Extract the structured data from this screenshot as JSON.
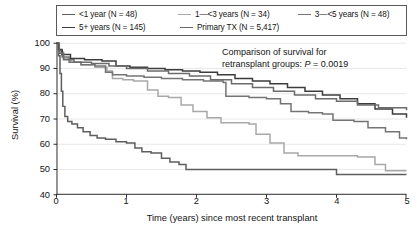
{
  "chart_data": {
    "type": "line",
    "title": "",
    "subtitle": "",
    "xlabel": "Time (years) since most recent transplant",
    "ylabel": "Survival (%)",
    "xlim": [
      0,
      5
    ],
    "ylim": [
      40,
      100
    ],
    "xticks": [
      0,
      1,
      2,
      3,
      4,
      5
    ],
    "yticks": [
      40,
      50,
      60,
      70,
      80,
      90,
      100
    ],
    "grid": "horizontal",
    "legend_position": "top",
    "annotation_line1": "Comparison of survival for",
    "annotation_line2_prefix": "retransplant groups: ",
    "annotation_p_symbol": "P",
    "annotation_p_value": " = 0.0019",
    "series": [
      {
        "name": "<1 year (N = 48)",
        "label": "<1 year (N = 48)",
        "color": "#5e5e5e",
        "n": 48,
        "points": [
          [
            0.0,
            100.0
          ],
          [
            0.03,
            95.0
          ],
          [
            0.05,
            88.0
          ],
          [
            0.07,
            81.0
          ],
          [
            0.09,
            75.0
          ],
          [
            0.12,
            71.0
          ],
          [
            0.16,
            69.0
          ],
          [
            0.22,
            68.0
          ],
          [
            0.3,
            66.5
          ],
          [
            0.38,
            65.0
          ],
          [
            0.48,
            63.5
          ],
          [
            0.58,
            62.5
          ],
          [
            0.7,
            62.0
          ],
          [
            0.85,
            61.0
          ],
          [
            1.0,
            60.5
          ],
          [
            1.12,
            58.5
          ],
          [
            1.22,
            57.0
          ],
          [
            1.35,
            56.5
          ],
          [
            1.5,
            54.5
          ],
          [
            1.62,
            53.0
          ],
          [
            1.75,
            52.0
          ],
          [
            1.85,
            50.0
          ],
          [
            2.6,
            50.0
          ],
          [
            3.9,
            50.0
          ],
          [
            4.0,
            48.0
          ],
          [
            5.0,
            48.0
          ]
        ]
      },
      {
        "name": "1—<3 years (N = 34)",
        "label": "1—<3 years (N = 34)",
        "color": "#a8a8a8",
        "n": 34,
        "points": [
          [
            0.0,
            100.0
          ],
          [
            0.04,
            96.5
          ],
          [
            0.1,
            94.0
          ],
          [
            0.2,
            92.5
          ],
          [
            0.35,
            91.5
          ],
          [
            0.55,
            90.5
          ],
          [
            0.72,
            89.0
          ],
          [
            0.8,
            86.0
          ],
          [
            0.95,
            85.5
          ],
          [
            1.1,
            85.0
          ],
          [
            1.3,
            81.5
          ],
          [
            1.45,
            79.0
          ],
          [
            1.6,
            78.5
          ],
          [
            1.78,
            75.5
          ],
          [
            1.95,
            73.0
          ],
          [
            2.15,
            70.5
          ],
          [
            2.35,
            68.5
          ],
          [
            2.75,
            68.0
          ],
          [
            2.85,
            64.0
          ],
          [
            3.05,
            60.5
          ],
          [
            3.25,
            56.5
          ],
          [
            3.45,
            55.5
          ],
          [
            4.3,
            55.0
          ],
          [
            4.55,
            52.0
          ],
          [
            4.7,
            49.5
          ],
          [
            5.0,
            49.5
          ]
        ]
      },
      {
        "name": "3—<5 years (N = 48)",
        "label": "3—<5 years (N = 48)",
        "color": "#747474",
        "n": 48,
        "points": [
          [
            0.0,
            100.0
          ],
          [
            0.03,
            97.0
          ],
          [
            0.08,
            94.5
          ],
          [
            0.18,
            92.5
          ],
          [
            0.35,
            91.5
          ],
          [
            0.55,
            91.0
          ],
          [
            0.7,
            88.5
          ],
          [
            0.8,
            87.5
          ],
          [
            1.0,
            87.0
          ],
          [
            1.25,
            86.5
          ],
          [
            1.5,
            86.0
          ],
          [
            1.8,
            85.5
          ],
          [
            2.1,
            85.0
          ],
          [
            2.38,
            84.5
          ],
          [
            2.42,
            79.0
          ],
          [
            2.75,
            78.5
          ],
          [
            3.0,
            78.0
          ],
          [
            3.2,
            76.0
          ],
          [
            3.35,
            73.0
          ],
          [
            3.6,
            72.5
          ],
          [
            3.8,
            72.0
          ],
          [
            3.95,
            69.5
          ],
          [
            4.25,
            69.0
          ],
          [
            4.45,
            66.5
          ],
          [
            4.7,
            65.0
          ],
          [
            4.9,
            62.5
          ],
          [
            5.0,
            62.0
          ]
        ]
      },
      {
        "name": "5+ years (N = 145)",
        "label": "5+ years (N = 145)",
        "color": "#3c3c3c",
        "n": 145,
        "points": [
          [
            0.0,
            100.0
          ],
          [
            0.03,
            97.5
          ],
          [
            0.08,
            95.5
          ],
          [
            0.2,
            94.0
          ],
          [
            0.4,
            93.5
          ],
          [
            0.65,
            93.0
          ],
          [
            0.85,
            91.0
          ],
          [
            1.05,
            90.5
          ],
          [
            1.3,
            90.0
          ],
          [
            1.55,
            89.5
          ],
          [
            1.8,
            89.0
          ],
          [
            2.05,
            88.5
          ],
          [
            2.3,
            87.5
          ],
          [
            2.55,
            86.0
          ],
          [
            2.8,
            85.0
          ],
          [
            3.05,
            84.0
          ],
          [
            3.3,
            82.5
          ],
          [
            3.55,
            81.0
          ],
          [
            3.8,
            79.5
          ],
          [
            4.05,
            78.0
          ],
          [
            4.3,
            76.0
          ],
          [
            4.55,
            74.0
          ],
          [
            4.8,
            72.0
          ],
          [
            5.0,
            70.5
          ]
        ]
      },
      {
        "name": "Primary TX (N = 5,417)",
        "label": "Primary TX (N = 5,417)",
        "color": "#6b6b6b",
        "n": 5417,
        "points": [
          [
            0.0,
            100.0
          ],
          [
            0.04,
            96.0
          ],
          [
            0.1,
            93.5
          ],
          [
            0.25,
            92.5
          ],
          [
            0.5,
            92.0
          ],
          [
            0.75,
            91.0
          ],
          [
            1.0,
            90.0
          ],
          [
            1.3,
            89.0
          ],
          [
            1.6,
            88.0
          ],
          [
            1.9,
            87.0
          ],
          [
            2.2,
            85.5
          ],
          [
            2.5,
            84.0
          ],
          [
            2.8,
            82.5
          ],
          [
            3.1,
            81.0
          ],
          [
            3.4,
            79.5
          ],
          [
            3.7,
            78.0
          ],
          [
            4.0,
            77.0
          ],
          [
            4.3,
            75.5
          ],
          [
            4.6,
            74.5
          ],
          [
            5.0,
            73.5
          ]
        ]
      }
    ]
  },
  "legend": {
    "rows": [
      [
        {
          "label": "<1 year (N = 48)",
          "color": "#5e5e5e"
        },
        {
          "label": "1—<3 years (N = 34)",
          "color": "#a8a8a8"
        },
        {
          "label": "3—<5 years (N = 48)",
          "color": "#747474"
        }
      ],
      [
        {
          "label": "5+ years (N = 145)",
          "color": "#3c3c3c"
        },
        {
          "label": "Primary TX (N = 5,417)",
          "color": "#6b6b6b"
        }
      ]
    ]
  }
}
